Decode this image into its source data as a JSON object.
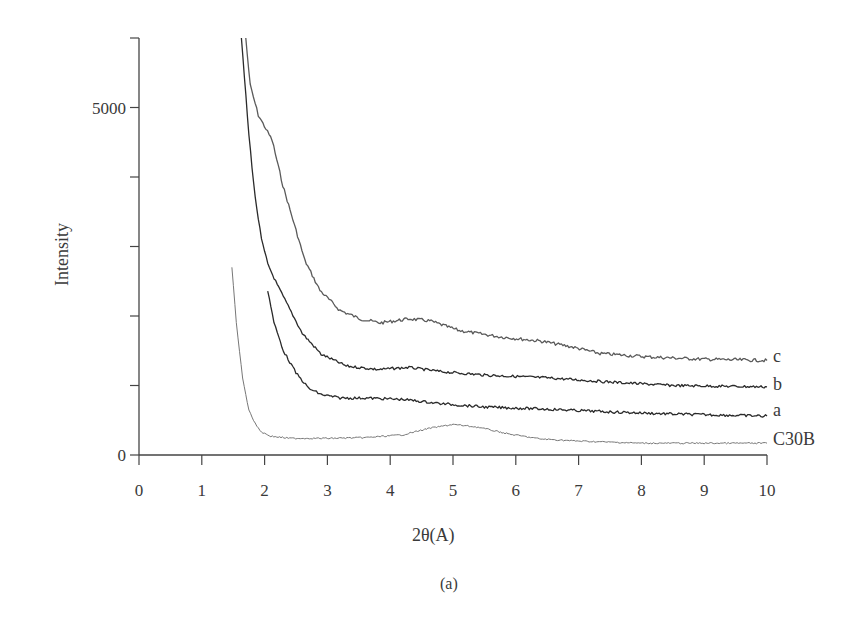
{
  "chart_data": {
    "type": "line",
    "title": "",
    "xlabel": "2θ(A)",
    "ylabel": "Intensity",
    "caption": "(a)",
    "xlim": [
      0,
      10
    ],
    "ylim": [
      0,
      6000
    ],
    "x_ticks": [
      "0",
      "1",
      "2",
      "3",
      "4",
      "5",
      "6",
      "7",
      "8",
      "9",
      "10"
    ],
    "y_ticks": [
      {
        "value": 0,
        "label": "0"
      },
      {
        "value": 1000,
        "label": ""
      },
      {
        "value": 2000,
        "label": ""
      },
      {
        "value": 3000,
        "label": ""
      },
      {
        "value": 4000,
        "label": ""
      },
      {
        "value": 5000,
        "label": "5000"
      },
      {
        "value": 6000,
        "label": ""
      }
    ],
    "grid": false,
    "legend": "inline labels at right end of curves",
    "series": [
      {
        "name": "c",
        "color": "#5a5a5a",
        "x": [
          1.7,
          1.77,
          1.9,
          2.12,
          2.29,
          2.43,
          2.64,
          2.88,
          3.2,
          3.52,
          3.84,
          4.31,
          4.63,
          5.1,
          5.75,
          6.39,
          6.87,
          7.34,
          8.14,
          8.93,
          10.0
        ],
        "y": [
          6000,
          5320,
          4890,
          4530,
          3880,
          3450,
          2800,
          2370,
          2080,
          1960,
          1900,
          1960,
          1930,
          1790,
          1700,
          1640,
          1560,
          1460,
          1410,
          1380,
          1360
        ]
      },
      {
        "name": "b",
        "color": "#2a2a2a",
        "x": [
          1.63,
          1.75,
          1.85,
          1.95,
          2.05,
          2.2,
          2.4,
          2.6,
          2.9,
          3.3,
          3.8,
          4.3,
          4.8,
          5.5,
          6.5,
          7.5,
          8.5,
          10.0
        ],
        "y": [
          6000,
          4600,
          3700,
          3100,
          2750,
          2450,
          2100,
          1750,
          1450,
          1280,
          1230,
          1260,
          1200,
          1150,
          1110,
          1050,
          1000,
          980
        ]
      },
      {
        "name": "a",
        "color": "#2a2a2a",
        "x": [
          2.05,
          2.15,
          2.3,
          2.5,
          2.7,
          2.9,
          3.2,
          3.6,
          4.2,
          4.8,
          5.5,
          6.5,
          7.5,
          8.5,
          10.0
        ],
        "y": [
          2370,
          1900,
          1500,
          1180,
          960,
          870,
          820,
          820,
          800,
          740,
          690,
          660,
          620,
          590,
          560
        ]
      },
      {
        "name": "C30B",
        "color": "#777777",
        "x": [
          1.48,
          1.55,
          1.65,
          1.75,
          1.85,
          1.95,
          2.1,
          2.4,
          3.0,
          3.6,
          4.2,
          4.6,
          5.0,
          5.4,
          5.9,
          6.4,
          7.0,
          8.0,
          9.0,
          10.0
        ],
        "y": [
          2700,
          1900,
          1100,
          650,
          450,
          330,
          270,
          240,
          240,
          250,
          290,
          380,
          440,
          400,
          300,
          230,
          200,
          170,
          170,
          170
        ]
      }
    ]
  },
  "labels": {
    "y_5000": "5000",
    "y_0": "0",
    "series_c": "c",
    "series_b": "b",
    "series_a": "a",
    "series_c30b": "C30B"
  }
}
